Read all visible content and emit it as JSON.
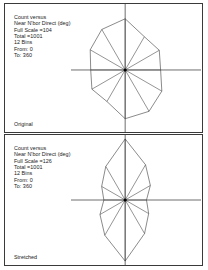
{
  "document": {
    "title": "Count versus Near N'bor Direct (deg) — Original vs Stretched"
  },
  "panels": [
    {
      "id": "original",
      "caption": "Original",
      "info": {
        "line1": "Count versus",
        "line2": "Near N'bor Direct (deg)",
        "line3": "Full Scale =104",
        "line4": "Total =1001",
        "line5": "12 Bins",
        "line6": "From: 0",
        "line7": "To: 360"
      }
    },
    {
      "id": "stretched",
      "caption": "Stretched",
      "info": {
        "line1": "Count versus",
        "line2": "Near N'bor Direct (deg)",
        "line3": "Full Scale =126",
        "line4": "Total =1001",
        "line5": "12 Bins",
        "line6": "From: 0",
        "line7": "To: 360"
      }
    }
  ],
  "chart_data": [
    {
      "type": "rose",
      "id": "original",
      "title": "Count versus Near N'bor Direct (deg)",
      "subtitle": "Original",
      "xlabel": "Near N'bor Direct (deg)",
      "ylabel": "Count",
      "bins": 12,
      "bin_width_deg": 30,
      "from_deg": 0,
      "to_deg": 360,
      "full_scale": 104,
      "total": 1001,
      "grid": false,
      "legend": "none",
      "categories": [
        0,
        30,
        60,
        90,
        120,
        150,
        180,
        210,
        240,
        270,
        300,
        330
      ],
      "values": [
        104,
        78,
        80,
        72,
        86,
        97,
        99,
        74,
        78,
        70,
        82,
        95
      ]
    },
    {
      "type": "rose",
      "id": "stretched",
      "title": "Count versus Near N'bor Direct (deg)",
      "subtitle": "Stretched",
      "xlabel": "Near N'bor Direct (deg)",
      "ylabel": "Count",
      "bins": 12,
      "bin_width_deg": 30,
      "from_deg": 0,
      "to_deg": 360,
      "full_scale": 126,
      "total": 1001,
      "grid": false,
      "legend": "none",
      "categories": [
        0,
        30,
        60,
        90,
        120,
        150,
        180,
        210,
        240,
        270,
        300,
        330
      ],
      "values": [
        126,
        84,
        60,
        44,
        56,
        80,
        126,
        84,
        60,
        44,
        56,
        80
      ]
    }
  ]
}
